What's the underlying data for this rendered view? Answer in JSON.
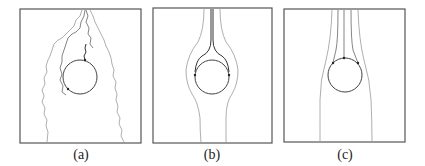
{
  "figure": {
    "panels": [
      {
        "id": "a",
        "caption": "(a)",
        "description": "irregular rough flow paths around circular obstacle"
      },
      {
        "id": "b",
        "caption": "(b)",
        "description": "smooth streamlines splitting around circle with two side contact points"
      },
      {
        "id": "c",
        "caption": "(c)",
        "description": "multiple parallel streamlines meeting top of circle at three contact points"
      }
    ]
  },
  "colors": {
    "frame": "#555555",
    "line_light": "#999999",
    "line_dark": "#333333"
  }
}
